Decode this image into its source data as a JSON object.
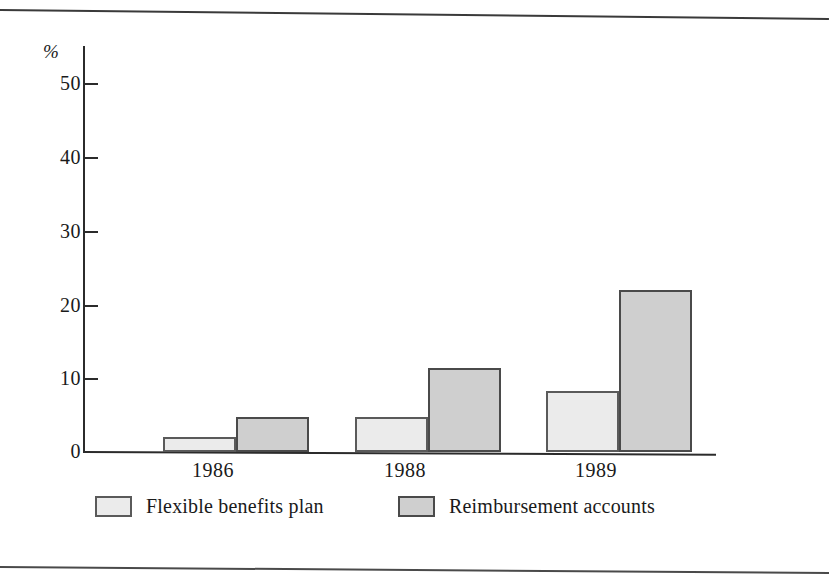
{
  "chart_data": {
    "type": "bar",
    "title": "",
    "subtitle": "",
    "xlabel": "",
    "ylabel": "%",
    "categories": [
      "1986",
      "1988",
      "1989"
    ],
    "series": [
      {
        "name": "Flexible benefits plan",
        "values": [
          2.0,
          4.7,
          8.3
        ],
        "color": "#ebebeb"
      },
      {
        "name": "Reimbursement accounts",
        "values": [
          4.8,
          11.4,
          22.0
        ],
        "color": "#cfcfcf"
      }
    ],
    "ylim": [
      0,
      50
    ],
    "yticks": [
      0,
      10,
      20,
      30,
      40,
      50
    ],
    "ytick_labels": [
      "0",
      "10",
      "20",
      "30",
      "40",
      "50"
    ],
    "grid": false,
    "legend_position": "bottom"
  },
  "axis": {
    "unit_label": "%",
    "tick_labels": [
      "50",
      "40",
      "30",
      "20",
      "10",
      "0"
    ]
  },
  "legend": {
    "items": [
      {
        "label": "Flexible benefits plan"
      },
      {
        "label": "Reimbursement accounts"
      }
    ]
  }
}
